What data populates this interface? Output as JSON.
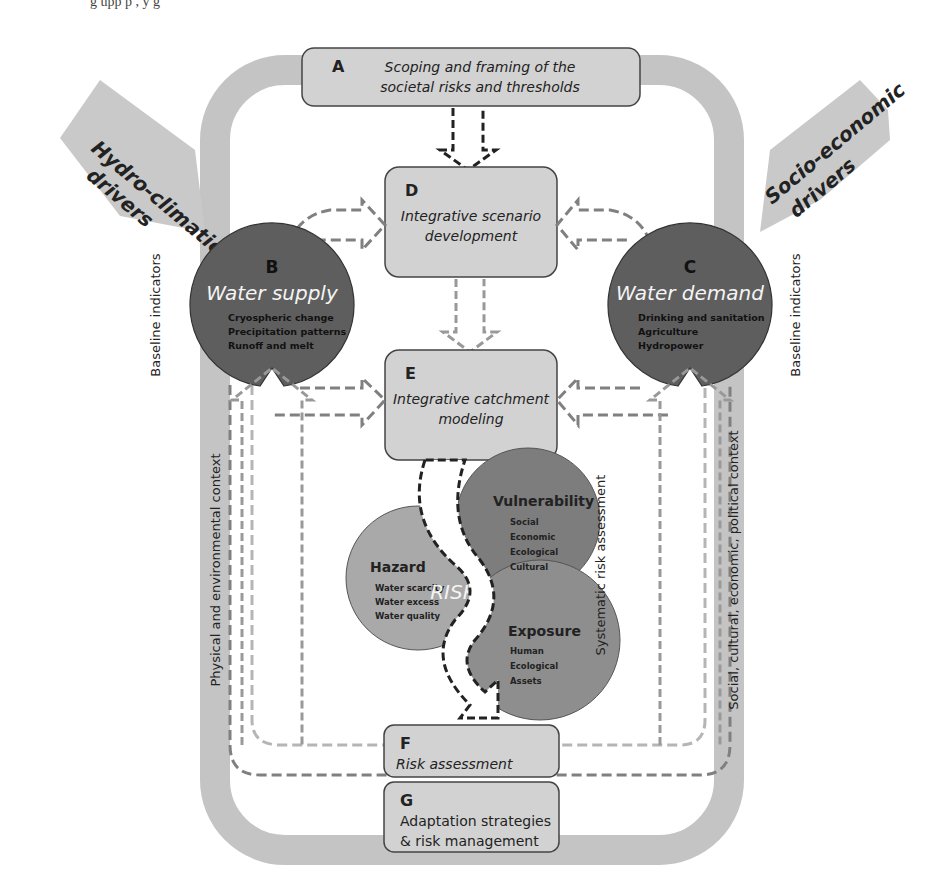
{
  "caption_fragment": "g                  upp                               p ,  y  g",
  "boxes": {
    "A": {
      "letter": "A",
      "line1": "Scoping and framing of the",
      "line2": "societal risks and thresholds"
    },
    "D": {
      "letter": "D",
      "line1": "Integrative scenario",
      "line2": "development"
    },
    "E": {
      "letter": "E",
      "line1": "Integrative catchment",
      "line2": "modeling"
    },
    "F": {
      "letter": "F",
      "line1": "Risk assessment"
    },
    "G": {
      "letter": "G",
      "line1": "Adaptation strategies",
      "line2": "& risk management"
    }
  },
  "circles": {
    "B": {
      "letter": "B",
      "title": "Water supply",
      "items": [
        "Cryospheric change",
        "Precipitation patterns",
        "Runoff and melt"
      ]
    },
    "C": {
      "letter": "C",
      "title": "Water demand",
      "items": [
        "Drinking and sanitation",
        "Agriculture",
        "Hydropower"
      ]
    }
  },
  "drivers": {
    "left": {
      "line1": "Hydro-climatic",
      "line2": "drivers"
    },
    "right": {
      "line1": "Socio-economic",
      "line2": "drivers"
    }
  },
  "side_labels": {
    "baseline_left": "Baseline indicators",
    "baseline_right": "Baseline indicators",
    "physical_context": "Physical and environmental context",
    "social_context": "Social, cultural, economic, political context",
    "systematic": "Systematic risk assessment"
  },
  "risk": {
    "center": "RISK",
    "hazard": {
      "title": "Hazard",
      "items": [
        "Water scarcity",
        "Water excess",
        "Water quality",
        "..."
      ]
    },
    "vulnerability": {
      "title": "Vulnerability",
      "items": [
        "Social",
        "Economic",
        "Ecological",
        "Cultural",
        "..."
      ]
    },
    "exposure": {
      "title": "Exposure",
      "items": [
        "Human",
        "Ecological",
        "Assets",
        "..."
      ]
    }
  },
  "colors": {
    "loop": "#c4c4c4",
    "box_fill": "#d2d2d2",
    "box_stroke": "#444444",
    "circle_dark": "#5e5e5e",
    "hazard": "#a9a9a9",
    "vulnerability": "#7d7d7d",
    "exposure": "#8e8e8e",
    "dash_dark": "#808080",
    "dash_light": "#b5b5b5",
    "driver": "#c9c9c9"
  }
}
